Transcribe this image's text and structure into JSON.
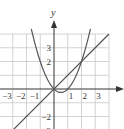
{
  "chart_data": {
    "type": "line",
    "title": "",
    "xlabel": "",
    "ylabel": "y",
    "xlim": [
      -4,
      5
    ],
    "ylim": [
      -3,
      6.5
    ],
    "grid": true,
    "x_tick_labels": [
      "-3",
      "-2",
      "-1",
      "1",
      "2",
      "3"
    ],
    "y_tick_labels": [
      "3",
      "2",
      "-2",
      "-3"
    ],
    "series": [
      {
        "name": "parabola y = x^2 - x",
        "type": "curve",
        "points": [
          [
            -1.6,
            4.16
          ],
          [
            -1,
            2
          ],
          [
            0,
            0
          ],
          [
            0.5,
            -0.25
          ],
          [
            1,
            0
          ],
          [
            2,
            2
          ],
          [
            2.6,
            4.16
          ]
        ]
      },
      {
        "name": "line y = x",
        "type": "line",
        "points": [
          [
            -3.5,
            -3.5
          ],
          [
            4,
            4
          ]
        ]
      }
    ],
    "intersections": [
      [
        0,
        0
      ],
      [
        2,
        2
      ]
    ]
  },
  "labels": {
    "y_axis": "y",
    "x_ticks": [
      {
        "t": "−3",
        "v": -3
      },
      {
        "t": "−2",
        "v": -2
      },
      {
        "t": "−1",
        "v": -1
      },
      {
        "t": "1",
        "v": 1
      },
      {
        "t": "2",
        "v": 2
      },
      {
        "t": "3",
        "v": 3
      }
    ],
    "y_ticks": [
      {
        "t": "3",
        "v": 3
      },
      {
        "t": "2",
        "v": 2
      },
      {
        "t": "−2",
        "v": -2
      },
      {
        "t": "−3",
        "v": -3
      }
    ]
  }
}
